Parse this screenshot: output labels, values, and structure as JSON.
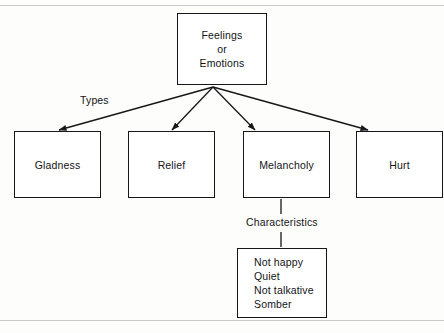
{
  "diagram": {
    "root": {
      "id": "feelings-or-emotions",
      "lines": [
        "Feelings",
        "or",
        "Emotions"
      ]
    },
    "relation_labels": {
      "types": "Types",
      "characteristics": "Characteristics"
    },
    "types": [
      {
        "id": "gladness",
        "label": "Gladness"
      },
      {
        "id": "relief",
        "label": "Relief"
      },
      {
        "id": "melancholy",
        "label": "Melancholy"
      },
      {
        "id": "hurt",
        "label": "Hurt"
      }
    ],
    "characteristics": {
      "id": "melancholy-characteristics",
      "of": "Melancholy",
      "lines": [
        "Not happy",
        "Quiet",
        "Not talkative",
        "Somber"
      ]
    },
    "colors": {
      "ink": "#141416",
      "stroke": "#17171a",
      "paper": "#fdfdfc",
      "page_rule": "#c9c9c9"
    }
  }
}
